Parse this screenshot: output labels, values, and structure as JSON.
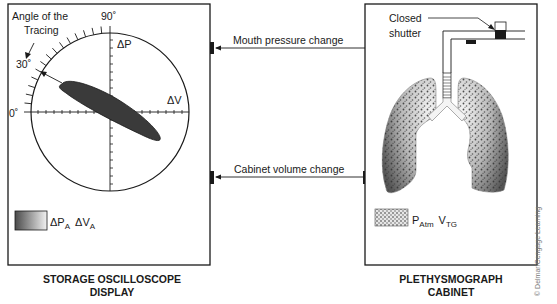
{
  "oscilloscope": {
    "title_line1": "STORAGE OSCILLOSCOPE",
    "title_line2": "DISPLAY",
    "angle_label_line1": "Angle of the",
    "angle_label_line2": "Tracing",
    "angle_90": "90˚",
    "angle_30": "30˚",
    "angle_0": "0˚",
    "axis_p": "ΔP",
    "axis_v": "ΔV",
    "legend": {
      "delta_p": "ΔP",
      "sub_a1": "A",
      "delta_v": "ΔV",
      "sub_a2": "A"
    }
  },
  "signals": {
    "mouth_pressure": "Mouth pressure change",
    "cabinet_volume": "Cabinet volume change"
  },
  "cabinet": {
    "title_line1": "PLETHYSMOGRAPH",
    "title_line2": "CABINET",
    "shutter_line1": "Closed",
    "shutter_line2": "shutter",
    "legend": {
      "p": "P",
      "p_sub": "Atm",
      "v": "V",
      "v_sub": "TG"
    }
  },
  "credit": "© Delmar/Cengage Learning",
  "colors": {
    "line": "#1a1a1a",
    "tracing_fill": "#3a3a3a",
    "lung_dark": "#6a6a6a",
    "lung_light": "#e8e8e8"
  }
}
